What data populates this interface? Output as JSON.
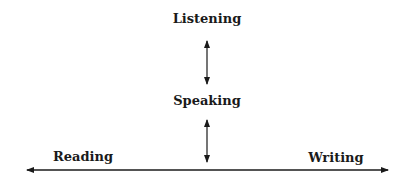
{
  "diagram": {
    "type": "language-skills-relationship",
    "nodes": {
      "listening": {
        "label": "Listening"
      },
      "speaking": {
        "label": "Speaking"
      },
      "reading": {
        "label": "Reading"
      },
      "writing": {
        "label": "Writing"
      }
    },
    "edges": [
      {
        "from": "listening",
        "to": "speaking",
        "style": "double-arrow",
        "orientation": "vertical"
      },
      {
        "from": "speaking",
        "to": "reading-writing-axis",
        "style": "double-arrow",
        "orientation": "vertical"
      },
      {
        "from": "reading",
        "to": "writing",
        "style": "double-arrow",
        "orientation": "horizontal"
      }
    ],
    "colors": {
      "line": "#1a1a1a",
      "text": "#1a1a1a",
      "background": "#ffffff"
    }
  }
}
